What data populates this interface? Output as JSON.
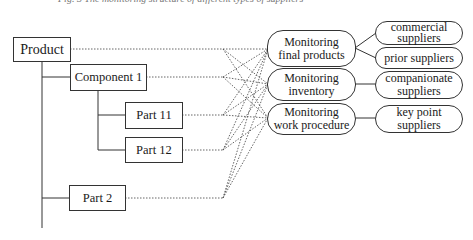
{
  "caption": "Fig. 3  The monitoring structure of different types of suppliers",
  "hierarchy": {
    "product": "Product",
    "component_1": "Component 1",
    "part_11": "Part 11",
    "part_12": "Part 12",
    "part_2": "Part 2"
  },
  "monitoring": [
    {
      "line1": "Monitoring",
      "line2": "final products"
    },
    {
      "line1": "Monitoring",
      "line2": "inventory"
    },
    {
      "line1": "Monitoring",
      "line2": "work procedure"
    }
  ],
  "suppliers": [
    {
      "line1": "commercial",
      "line2": "suppliers"
    },
    {
      "line1": "prior suppliers",
      "line2": ""
    },
    {
      "line1": "companionate",
      "line2": "suppliers"
    },
    {
      "line1": "key point",
      "line2": "suppliers"
    }
  ],
  "connections": {
    "hierarchy_to_monitoring": "each of Product, Component 1, Part 11, Part 12, Part 2 connects (dotted) to all three monitoring nodes",
    "monitoring_to_suppliers": [
      {
        "from": "Monitoring final products",
        "to": [
          "commercial suppliers",
          "prior suppliers"
        ]
      },
      {
        "from": "Monitoring inventory",
        "to": [
          "companionate suppliers"
        ]
      },
      {
        "from": "Monitoring work procedure",
        "to": [
          "key point suppliers"
        ]
      }
    ]
  }
}
